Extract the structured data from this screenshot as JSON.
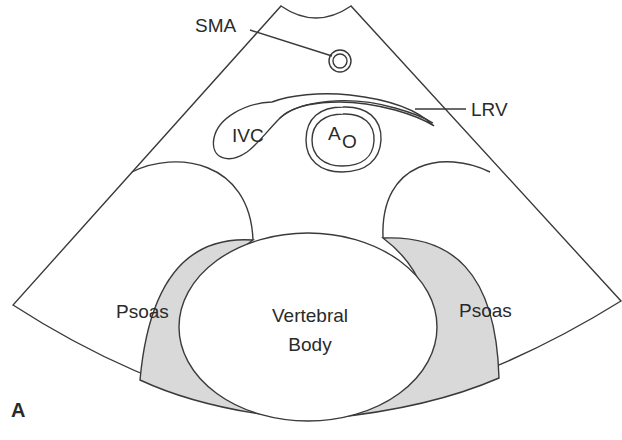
{
  "figure": {
    "panel_label": "A",
    "view": "transverse ultrasound sector"
  },
  "labels": {
    "sma": "SMA",
    "lrv": "LRV",
    "ivc": "IVC",
    "aorta_main": "A",
    "aorta_sub": "O",
    "vertebral_line1": "Vertebral",
    "vertebral_line2": "Body",
    "psoas_left": "Psoas",
    "psoas_right": "Psoas"
  },
  "colors": {
    "stroke": "#3a3a3a",
    "psoas_fill": "#d9d9d9",
    "background": "#ffffff",
    "text": "#2a2a2a"
  }
}
